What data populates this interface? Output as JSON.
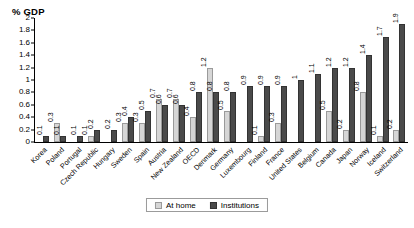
{
  "chart_data": {
    "type": "bar",
    "title": "",
    "subtitle": "",
    "xlabel": "",
    "ylabel": "% GDP",
    "ylim": [
      0,
      2
    ],
    "yticks": [
      "0",
      "0.2",
      "0.4",
      "0.6",
      "0.8",
      "1",
      "1.2",
      "1.4",
      "1.6",
      "1.8",
      "2"
    ],
    "ytick_values": [
      0,
      0.2,
      0.4,
      0.6,
      0.8,
      1.0,
      1.2,
      1.4,
      1.6,
      1.8,
      2.0
    ],
    "grid": false,
    "legend_position": "bottom",
    "categories": [
      "Korea",
      "Poland",
      "Portugal",
      "Czech Republic",
      "Hungary",
      "Sweden",
      "Spain",
      "Austria",
      "New Zealand",
      "OECD",
      "Denmark",
      "Germany",
      "Luxembourg",
      "Finland",
      "France",
      "United States",
      "Belgium",
      "Canada",
      "Japan",
      "Norway",
      "Iceland",
      "Switzerland"
    ],
    "series": [
      {
        "name": "At home",
        "color": "#d6d6d6",
        "values": [
          null,
          0.3,
          null,
          0.1,
          null,
          0.3,
          0.3,
          0.7,
          0.7,
          0.4,
          1.2,
          0.5,
          null,
          0.1,
          0.3,
          null,
          null,
          0.5,
          0.2,
          0.8,
          0.1,
          0.2
        ],
        "labels": [
          "",
          "0.3",
          "",
          "0.1",
          "",
          "0.3",
          "0.3",
          "0.7",
          "0.7",
          "0.4",
          "1.2",
          "0.5",
          "",
          "0.1",
          "0.3",
          "",
          "",
          "0.5",
          "0.2",
          "0.8",
          "0.1",
          "0.2"
        ]
      },
      {
        "name": "Institutions",
        "color": "#4a4a4a",
        "values": [
          0.1,
          0.1,
          0.1,
          0.2,
          0.2,
          0.4,
          0.5,
          0.6,
          0.6,
          0.8,
          0.8,
          0.8,
          0.9,
          0.9,
          0.9,
          1.0,
          1.1,
          1.2,
          1.2,
          1.4,
          1.7,
          1.9
        ],
        "labels": [
          "0.1",
          "0.1",
          "0.1",
          "0.2",
          "0.2",
          "0.4",
          "0.5",
          "0.6",
          "0.6",
          "0.8",
          "0.8",
          "0.8",
          "0.9",
          "0.9",
          "0.9",
          "1",
          "1.1",
          "1.2",
          "1.2",
          "1.4",
          "1.7",
          "1.9"
        ]
      }
    ]
  },
  "legend": {
    "items": [
      {
        "label": "At home",
        "swatch": "home"
      },
      {
        "label": "Institutions",
        "swatch": "inst"
      }
    ]
  },
  "colors": {
    "at_home": "#d6d6d6",
    "institutions": "#4a4a4a",
    "axis": "#000000",
    "background": "#ffffff"
  }
}
